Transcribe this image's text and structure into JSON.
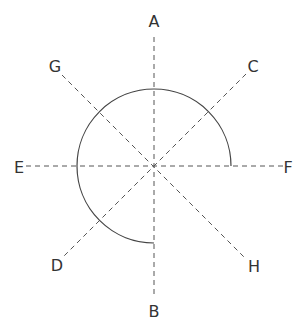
{
  "diagram": {
    "center": {
      "x": 154,
      "y": 166
    },
    "radius": 77,
    "arc": {
      "description": "three-quarter circle arc from direction F (right) counter-clockwise through A (top) and E (left) ending at B (bottom)",
      "start_direction": "F",
      "end_direction": "B",
      "sweep_degrees": 270,
      "color": "#444444"
    },
    "lines": [
      {
        "from": "A",
        "to": "B",
        "style": "dashed"
      },
      {
        "from": "E",
        "to": "F",
        "style": "dashed"
      },
      {
        "from": "G",
        "to": "H",
        "style": "dashed"
      },
      {
        "from": "C",
        "to": "D",
        "style": "dashed"
      }
    ],
    "labels": {
      "A": "A",
      "B": "B",
      "C": "C",
      "D": "D",
      "E": "E",
      "F": "F",
      "G": "G",
      "H": "H"
    },
    "line_color": "#555555",
    "label_color": "#333333"
  }
}
